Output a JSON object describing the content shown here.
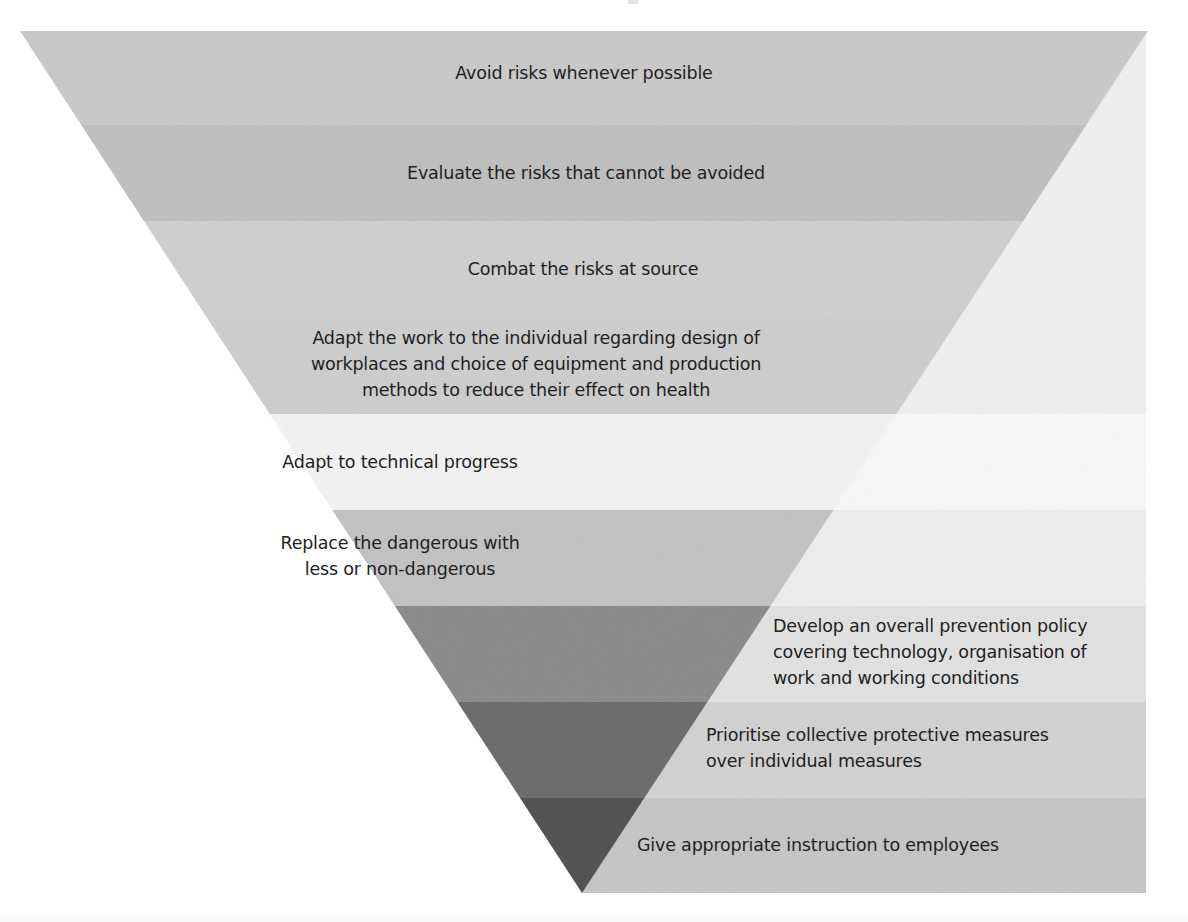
{
  "diagram": {
    "type": "inverted-pyramid",
    "title": "",
    "apex": {
      "x": 582,
      "y": 893
    },
    "top_left": {
      "x": 20,
      "y": 31
    },
    "top_right": {
      "x": 1148,
      "y": 31
    },
    "panel_right_x": 1146,
    "levels": [
      {
        "index": 1,
        "text": "Avoid risks whenever possible",
        "y_top": 31,
        "y_bottom": 125,
        "fill": "#cdcdcd",
        "panel_fill": "#f3f3f3",
        "label_x": 584,
        "label_y": 60,
        "align": "center"
      },
      {
        "index": 2,
        "text": "Evaluate the risks that cannot be avoided",
        "y_top": 125,
        "y_bottom": 221,
        "fill": "#c3c3c3",
        "panel_fill": "#f3f3f3",
        "label_x": 586,
        "label_y": 160,
        "align": "center"
      },
      {
        "index": 3,
        "text": "Combat the risks at source",
        "y_top": 221,
        "y_bottom": 318,
        "fill": "#d3d3d3",
        "panel_fill": "#f3f3f3",
        "label_x": 583,
        "label_y": 256,
        "align": "center"
      },
      {
        "index": 4,
        "text": "Adapt the work to the individual regarding design of\nworkplaces and choice of equipment and production\nmethods to reduce their effect on health",
        "y_top": 318,
        "y_bottom": 414,
        "fill": "#d1d1d1",
        "panel_fill": "#f3f3f3",
        "label_x": 536,
        "label_y": 325,
        "align": "center"
      },
      {
        "index": 5,
        "text": "Adapt to technical progress",
        "y_top": 414,
        "y_bottom": 510,
        "fill": "#f6f6f6",
        "panel_fill": "#fbfbfb",
        "label_x": 400,
        "label_y": 449,
        "align": "center"
      },
      {
        "index": 6,
        "text": "Replace the dangerous with\nless or non-dangerous",
        "y_top": 510,
        "y_bottom": 606,
        "fill": "#c6c6c6",
        "panel_fill": "#f1f1f1",
        "label_x": 400,
        "label_y": 530,
        "align": "center"
      },
      {
        "index": 7,
        "text": "Develop an overall prevention policy\ncovering technology, organisation of\nwork and working conditions",
        "y_top": 606,
        "y_bottom": 702,
        "fill": "#8f8f8f",
        "panel_fill": "#e5e5e5",
        "label_x": 773,
        "label_y": 613,
        "align": "left"
      },
      {
        "index": 8,
        "text": "Prioritise collective protective measures\nover individual measures",
        "y_top": 702,
        "y_bottom": 798,
        "fill": "#6f6f6f",
        "panel_fill": "#d5d5d5",
        "label_x": 706,
        "label_y": 722,
        "align": "left"
      },
      {
        "index": 9,
        "text": "Give appropriate instruction to employees",
        "y_top": 798,
        "y_bottom": 893,
        "fill": "#575757",
        "panel_fill": "#c9c9c9",
        "label_x": 637,
        "label_y": 832,
        "align": "left"
      }
    ]
  }
}
